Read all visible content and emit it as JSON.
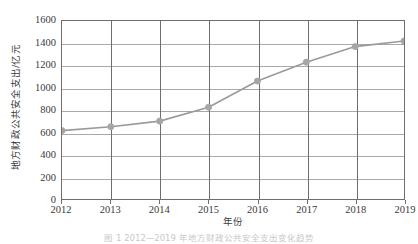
{
  "chart_data": {
    "type": "line",
    "title": "",
    "xlabel": "年份",
    "ylabel": "地方财政公共安全支出/亿元",
    "categories": [
      2012,
      2013,
      2014,
      2015,
      2016,
      2017,
      2018,
      2019
    ],
    "x_tick_labels": [
      "2012",
      "2013",
      "2014",
      "2015",
      "2016",
      "2017",
      "2018",
      "2019"
    ],
    "y_tick_labels": [
      "0",
      "200",
      "400",
      "600",
      "800",
      "1000",
      "1200",
      "1400",
      "1600"
    ],
    "y_ticks": [
      0,
      200,
      400,
      600,
      800,
      1000,
      1200,
      1400,
      1600
    ],
    "values": [
      615,
      650,
      700,
      825,
      1060,
      1230,
      1370,
      1420
    ],
    "series": [
      {
        "name": "地方财政公共安全支出",
        "values": [
          615,
          650,
          700,
          825,
          1060,
          1230,
          1370,
          1420
        ]
      }
    ],
    "xlim": [
      2012,
      2019
    ],
    "ylim": [
      0,
      1600
    ],
    "grid": "both",
    "legend": "none",
    "line_color": "#9a9a9a",
    "marker_color": "#a6a6a6",
    "marker_shape": "circle",
    "axis_color": "#6e6e6e",
    "gridline_color": "#a9a9a9"
  },
  "caption": {
    "text": "图 1  2012—2019 年地方财政公共安全支出变化趋势"
  }
}
